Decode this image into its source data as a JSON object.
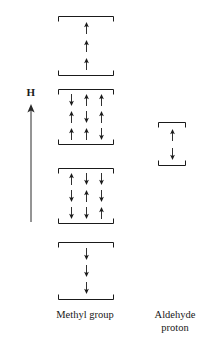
{
  "figure": {
    "title": "",
    "field_axis": {
      "label": "H",
      "direction": "up",
      "icon": "up-arrow-icon"
    },
    "captions": {
      "methyl": "Methyl group",
      "aldehyde_line1": "Aldehyde",
      "aldehyde_line2": "proton"
    },
    "colors": {
      "ink": "#1a1a1a",
      "background": "#ffffff"
    }
  },
  "chart_data": {
    "type": "diagram",
    "title": "Methyl group",
    "columns": [
      {
        "name": "Methyl group",
        "x": 58,
        "width": 56,
        "groups": [
          {
            "id": "methyl-group-1",
            "multiplicity": 1,
            "top": 16,
            "height": 60,
            "rows": [
              [
                "up"
              ],
              [
                "up"
              ],
              [
                "up"
              ]
            ]
          },
          {
            "id": "methyl-group-2",
            "multiplicity": 3,
            "top": 89,
            "height": 56,
            "rows": [
              [
                "down",
                "up",
                "up"
              ],
              [
                "up",
                "down",
                "up"
              ],
              [
                "up",
                "up",
                "down"
              ]
            ]
          },
          {
            "id": "methyl-group-3",
            "multiplicity": 3,
            "top": 168,
            "height": 56,
            "rows": [
              [
                "up",
                "down",
                "down"
              ],
              [
                "down",
                "up",
                "down"
              ],
              [
                "down",
                "down",
                "up"
              ]
            ]
          },
          {
            "id": "methyl-group-4",
            "multiplicity": 1,
            "top": 242,
            "height": 58,
            "rows": [
              [
                "down"
              ],
              [
                "down"
              ],
              [
                "down"
              ]
            ]
          }
        ]
      },
      {
        "name": "Aldehyde proton",
        "x": 158,
        "width": 28,
        "groups": [
          {
            "id": "aldehyde-group-1",
            "multiplicity": 1,
            "top": 122,
            "height": 44,
            "rows": [
              [
                "up"
              ],
              [
                "down"
              ]
            ]
          }
        ]
      }
    ],
    "intensity_ratio": [
      1,
      3,
      3,
      1
    ],
    "axis": {
      "label": "H",
      "orientation": "vertical",
      "arrow": "up"
    }
  }
}
